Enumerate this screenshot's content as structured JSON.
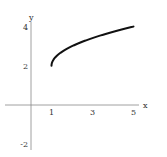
{
  "chart_data": {
    "type": "line",
    "title": "",
    "xlabel": "x",
    "ylabel": "y",
    "function": "y = 2 + sqrt(x - 1)",
    "xlim": [
      -1.5,
      6
    ],
    "ylim": [
      -2.3,
      4.3
    ],
    "xticks": [
      1,
      3,
      5
    ],
    "yticks": [
      -2,
      2,
      4
    ],
    "xtick_labels": [
      "1",
      "3",
      "5"
    ],
    "ytick_labels": [
      "-2",
      "2",
      "4"
    ],
    "grid": false,
    "legend": null,
    "series": [
      {
        "name": "curve",
        "x": [
          1,
          1.05,
          1.2,
          1.5,
          2,
          2.5,
          3,
          3.5,
          4,
          4.5,
          5
        ],
        "y": [
          2,
          2.224,
          2.447,
          2.707,
          3,
          3.225,
          3.414,
          3.581,
          3.732,
          3.871,
          4
        ]
      }
    ]
  },
  "colors": {
    "axis": "#888888",
    "curve": "#111111",
    "text": "#333333"
  }
}
